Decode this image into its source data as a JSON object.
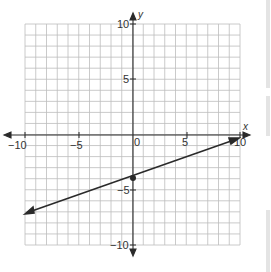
{
  "chart_data": {
    "type": "line",
    "title": "",
    "xlabel": "x",
    "ylabel": "y",
    "xlim": [
      -10,
      10
    ],
    "ylim": [
      -10,
      10
    ],
    "grid": true,
    "x_ticks": [
      -10,
      -5,
      0,
      5,
      10
    ],
    "y_ticks": [
      -10,
      -5,
      5,
      10
    ],
    "tick_labels": {
      "x": [
        "-10",
        "-5",
        "0",
        "5",
        "10"
      ],
      "y": [
        "10",
        "5",
        "-5",
        "-10"
      ]
    },
    "series": [
      {
        "name": "line",
        "equation": "y = 0.35x - 4",
        "x": [
          -10,
          0,
          9.6
        ],
        "y": [
          -7.2,
          -4,
          -0.3
        ],
        "marked_point": {
          "x": 0,
          "y": -4
        },
        "arrows_both_ends": true
      }
    ],
    "legend": null
  },
  "labels": {
    "x_axis": "x",
    "y_axis": "y",
    "x_neg10": "−10",
    "x_neg5": "−5",
    "x_0": "0",
    "x_5": "5",
    "x_10": "10",
    "y_10": "10",
    "y_5": "5",
    "y_neg5": "−5",
    "y_neg10": "−10"
  },
  "colors": {
    "grid": "#b8b8b8",
    "axis": "#2a2a2a",
    "line": "#2a2a2a",
    "background": "#ffffff"
  }
}
